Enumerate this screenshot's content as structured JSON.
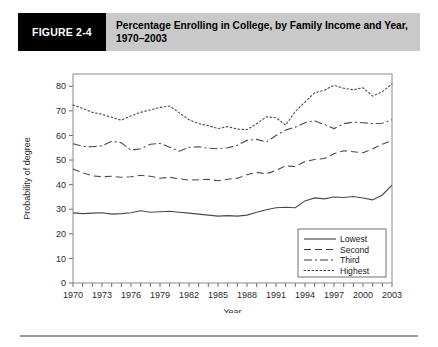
{
  "figure": {
    "badge_label": "FIGURE 2-4",
    "title": "Percentage Enrolling in College, by Family Income and Year, 1970–2003"
  },
  "chart_data": {
    "type": "line",
    "title": "Percentage Enrolling in College, by Family Income and Year, 1970–2003",
    "xlabel": "Year",
    "ylabel": "Probability of degree",
    "xlim": [
      1970,
      2003
    ],
    "ylim": [
      0,
      85
    ],
    "grid": false,
    "legend_position": "bottom-right",
    "xticks": [
      1970,
      1973,
      1976,
      1979,
      1982,
      1985,
      1988,
      1991,
      1994,
      1997,
      2000,
      2003
    ],
    "yticks": [
      0,
      10,
      20,
      30,
      40,
      50,
      60,
      70,
      80
    ],
    "x": [
      1970,
      1971,
      1972,
      1973,
      1974,
      1975,
      1976,
      1977,
      1978,
      1979,
      1980,
      1981,
      1982,
      1983,
      1984,
      1985,
      1986,
      1987,
      1988,
      1989,
      1990,
      1991,
      1992,
      1993,
      1994,
      1995,
      1996,
      1997,
      1998,
      1999,
      2000,
      2001,
      2002,
      2003
    ],
    "series": [
      {
        "name": "Lowest",
        "style": "solid",
        "values": [
          28.5,
          28.2,
          28.4,
          28.6,
          28.0,
          28.2,
          28.6,
          29.4,
          28.8,
          29.0,
          29.2,
          28.8,
          28.4,
          28.0,
          27.6,
          27.2,
          27.4,
          27.2,
          27.6,
          28.8,
          29.8,
          30.6,
          30.8,
          30.6,
          33.4,
          34.6,
          34.2,
          35.0,
          34.8,
          35.2,
          34.6,
          33.8,
          35.8,
          39.8
        ]
      },
      {
        "name": "Second",
        "style": "dashed",
        "values": [
          46.4,
          44.8,
          43.6,
          43.2,
          43.4,
          43.0,
          43.2,
          43.8,
          43.4,
          42.6,
          43.0,
          42.4,
          41.8,
          42.0,
          42.2,
          41.6,
          42.2,
          42.6,
          44.0,
          45.0,
          44.4,
          45.8,
          47.6,
          47.4,
          49.4,
          50.2,
          50.6,
          52.6,
          53.8,
          53.4,
          53.0,
          54.6,
          56.4,
          58.0
        ]
      },
      {
        "name": "Third",
        "style": "dashdot",
        "values": [
          56.6,
          55.6,
          55.4,
          55.8,
          57.6,
          57.0,
          54.0,
          54.6,
          56.4,
          56.8,
          55.2,
          53.6,
          55.2,
          55.4,
          54.8,
          54.6,
          55.0,
          56.0,
          58.0,
          58.4,
          57.4,
          60.0,
          62.2,
          63.4,
          65.2,
          66.0,
          64.4,
          62.8,
          64.8,
          65.4,
          65.2,
          64.8,
          65.0,
          66.4
        ]
      },
      {
        "name": "Highest",
        "style": "dotted",
        "values": [
          72.4,
          71.0,
          69.4,
          68.6,
          67.4,
          66.2,
          68.0,
          69.4,
          70.4,
          71.4,
          72.0,
          69.2,
          66.4,
          64.8,
          64.0,
          62.8,
          63.6,
          62.6,
          62.4,
          64.8,
          67.6,
          67.2,
          64.2,
          69.8,
          73.6,
          77.4,
          78.4,
          80.4,
          79.2,
          78.6,
          79.4,
          76.0,
          77.8,
          81.0
        ]
      }
    ]
  },
  "legend": {
    "items": [
      {
        "label": "Lowest",
        "style": "solid"
      },
      {
        "label": "Second",
        "style": "dashed"
      },
      {
        "label": "Third",
        "style": "dashdot"
      },
      {
        "label": "Highest",
        "style": "dotted"
      }
    ]
  }
}
